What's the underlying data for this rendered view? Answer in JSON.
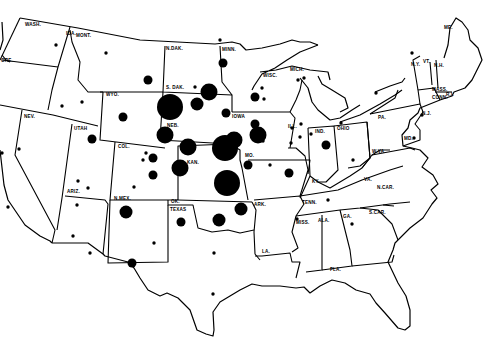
{
  "map": {
    "title": "",
    "style": "black-and-white outline map of the United States with proportional black circles",
    "colors": {
      "background": "#ffffff",
      "ink": "#000000"
    },
    "state_labels": [
      {
        "id": "wash",
        "text": "WASH."
      },
      {
        "id": "ore",
        "text": "ORE."
      },
      {
        "id": "ida",
        "text": "IDA."
      },
      {
        "id": "mont",
        "text": "MONT."
      },
      {
        "id": "ndak",
        "text": "N.DAK."
      },
      {
        "id": "minn",
        "text": "MINN."
      },
      {
        "id": "wyo",
        "text": "WYO."
      },
      {
        "id": "sdak",
        "text": "S. DAK."
      },
      {
        "id": "wisc",
        "text": "WISC."
      },
      {
        "id": "mich",
        "text": "MICH."
      },
      {
        "id": "nev",
        "text": "NEV."
      },
      {
        "id": "utah",
        "text": "UTAH"
      },
      {
        "id": "neb",
        "text": "NEB."
      },
      {
        "id": "iowa",
        "text": "IOWA"
      },
      {
        "id": "ill",
        "text": "ILL."
      },
      {
        "id": "ind",
        "text": "IND."
      },
      {
        "id": "ohio",
        "text": "OHIO"
      },
      {
        "id": "pa",
        "text": "PA."
      },
      {
        "id": "ny",
        "text": "N.Y."
      },
      {
        "id": "vt",
        "text": "VT."
      },
      {
        "id": "nh",
        "text": "N.H."
      },
      {
        "id": "me",
        "text": "ME."
      },
      {
        "id": "mass",
        "text": "MASS."
      },
      {
        "id": "conn",
        "text": "CONN."
      },
      {
        "id": "ri",
        "text": "R.I."
      },
      {
        "id": "nj",
        "text": "N.J."
      },
      {
        "id": "md",
        "text": "MD."
      },
      {
        "id": "col",
        "text": "COL."
      },
      {
        "id": "kan",
        "text": "KAN."
      },
      {
        "id": "mo",
        "text": "MO."
      },
      {
        "id": "ky",
        "text": "KY."
      },
      {
        "id": "wva",
        "text": "W.VA."
      },
      {
        "id": "va",
        "text": "VA."
      },
      {
        "id": "ariz",
        "text": "ARIZ."
      },
      {
        "id": "nmex",
        "text": "N.MEX."
      },
      {
        "id": "ok",
        "text": "OK."
      },
      {
        "id": "texas",
        "text": "TEXAS"
      },
      {
        "id": "ark",
        "text": "ARK."
      },
      {
        "id": "tenn",
        "text": "TENN."
      },
      {
        "id": "ncar",
        "text": "N.CAR."
      },
      {
        "id": "scar",
        "text": "S.CAR."
      },
      {
        "id": "ga",
        "text": "GA."
      },
      {
        "id": "ala",
        "text": "ALA."
      },
      {
        "id": "miss",
        "text": "MISS."
      },
      {
        "id": "la",
        "text": "LA."
      },
      {
        "id": "fla",
        "text": "FLA."
      }
    ],
    "symbols": [
      {
        "state": "WASH.",
        "size": "small"
      },
      {
        "state": "MONT.",
        "size": "small"
      },
      {
        "state": "MONT.",
        "size": "medium"
      },
      {
        "state": "MINN.",
        "size": "small"
      },
      {
        "state": "MINN.",
        "size": "medium"
      },
      {
        "state": "IDA.",
        "size": "small"
      },
      {
        "state": "IDA.",
        "size": "small"
      },
      {
        "state": "WYO.",
        "size": "medium"
      },
      {
        "state": "S. DAK.",
        "size": "very-large"
      },
      {
        "state": "S. DAK.",
        "size": "small"
      },
      {
        "state": "S. DAK.",
        "size": "large"
      },
      {
        "state": "S. DAK.",
        "size": "medium-large"
      },
      {
        "state": "S. DAK.",
        "size": "medium"
      },
      {
        "state": "CALIF.",
        "size": "small"
      },
      {
        "state": "NEV.",
        "size": "small"
      },
      {
        "state": "UTAH",
        "size": "medium"
      },
      {
        "state": "NEB.",
        "size": "large"
      },
      {
        "state": "NEB.",
        "size": "large"
      },
      {
        "state": "NEB.",
        "size": "very-large"
      },
      {
        "state": "IOWA",
        "size": "large"
      },
      {
        "state": "IOWA",
        "size": "medium"
      },
      {
        "state": "IOWA",
        "size": "large"
      },
      {
        "state": "COL.",
        "size": "small"
      },
      {
        "state": "COL.",
        "size": "small"
      },
      {
        "state": "COL.",
        "size": "medium"
      },
      {
        "state": "COL.",
        "size": "small"
      },
      {
        "state": "COL.",
        "size": "medium"
      },
      {
        "state": "KAN.",
        "size": "large"
      },
      {
        "state": "KAN.",
        "size": "very-large"
      },
      {
        "state": "MO.",
        "size": "medium"
      },
      {
        "state": "MO.",
        "size": "medium"
      },
      {
        "state": "UTAH",
        "size": "small"
      },
      {
        "state": "UTAH",
        "size": "small"
      },
      {
        "state": "ARIZ.",
        "size": "small"
      },
      {
        "state": "ARIZ.",
        "size": "small"
      },
      {
        "state": "ARIZ.",
        "size": "small"
      },
      {
        "state": "CALIF.",
        "size": "small"
      },
      {
        "state": "N.MEX.",
        "size": "medium-large"
      },
      {
        "state": "N.MEX.",
        "size": "small"
      },
      {
        "state": "TEXAS",
        "size": "medium"
      },
      {
        "state": "TEXAS",
        "size": "medium"
      },
      {
        "state": "TEXAS",
        "size": "small"
      },
      {
        "state": "TEXAS",
        "size": "small"
      },
      {
        "state": "OK.",
        "size": "medium-large"
      },
      {
        "state": "OK.",
        "size": "medium-large"
      },
      {
        "state": "WISC.",
        "size": "small"
      },
      {
        "state": "WISC.",
        "size": "medium"
      },
      {
        "state": "WISC.",
        "size": "small"
      },
      {
        "state": "WISC.",
        "size": "small"
      },
      {
        "state": "MICH.",
        "size": "small"
      },
      {
        "state": "MICH.",
        "size": "small"
      },
      {
        "state": "MICH.",
        "size": "small"
      },
      {
        "state": "ILL.",
        "size": "small"
      },
      {
        "state": "ILL.",
        "size": "small"
      },
      {
        "state": "ILL.",
        "size": "small"
      },
      {
        "state": "ILL.",
        "size": "small"
      },
      {
        "state": "ILL.",
        "size": "small"
      },
      {
        "state": "IND.",
        "size": "medium"
      },
      {
        "state": "IND.",
        "size": "small"
      },
      {
        "state": "OHIO",
        "size": "small"
      },
      {
        "state": "N.Y.",
        "size": "small"
      },
      {
        "state": "N.Y.",
        "size": "small"
      },
      {
        "state": "MD.",
        "size": "small"
      },
      {
        "state": "N.J.",
        "size": "small"
      },
      {
        "state": "TENN.",
        "size": "small"
      },
      {
        "state": "MISS.",
        "size": "small"
      },
      {
        "state": "GA.",
        "size": "small"
      }
    ]
  }
}
